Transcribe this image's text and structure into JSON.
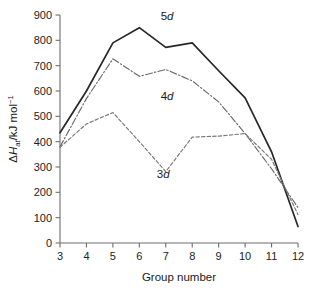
{
  "chart_data": {
    "type": "line",
    "title": "",
    "subtitle": "",
    "xlabel": "Group number",
    "ylabel": "ΔHₐₜ/kJ mol⁻¹",
    "ylabel_parts": {
      "delta": "Δ",
      "h": "H",
      "subscript": "at",
      "units": "/kJ mol",
      "exponent": "−1"
    },
    "x": [
      3,
      4,
      5,
      6,
      7,
      8,
      9,
      10,
      11,
      12
    ],
    "xtick_labels": [
      "3",
      "4",
      "5",
      "6",
      "7",
      "8",
      "9",
      "10",
      "11",
      "12"
    ],
    "ytick_labels": [
      "0",
      "100",
      "200",
      "300",
      "400",
      "500",
      "600",
      "700",
      "800",
      "900"
    ],
    "ytick_values": [
      0,
      100,
      200,
      300,
      400,
      500,
      600,
      700,
      800,
      900
    ],
    "xlim": [
      3,
      12
    ],
    "ylim": [
      0,
      900
    ],
    "grid": false,
    "legend_position": "inline-annotations",
    "series": [
      {
        "name": "5d",
        "label_html": "5<i>d</i>",
        "style": "solid",
        "color": "#272727",
        "values": [
          435,
          600,
          790,
          850,
          772,
          790,
          680,
          573,
          360,
          65
        ]
      },
      {
        "name": "4d",
        "label_html": "4<i>d</i>",
        "style": "dash-dot",
        "color": "#6a6a6a",
        "values": [
          380,
          570,
          727,
          658,
          685,
          640,
          557,
          432,
          293,
          140
        ]
      },
      {
        "name": "3d",
        "label_html": "3<i>d</i>",
        "style": "dashed",
        "color": "#777777",
        "values": [
          378,
          470,
          515,
          400,
          282,
          418,
          422,
          432,
          330,
          112
        ]
      }
    ],
    "annotations": [
      {
        "text": "5d",
        "digit": "5",
        "letter": "d",
        "x": 7.05,
        "y": 880
      },
      {
        "text": "4d",
        "digit": "4",
        "letter": "d",
        "x": 7.05,
        "y": 565
      },
      {
        "text": "3d",
        "digit": "3",
        "letter": "d",
        "x": 6.9,
        "y": 258
      }
    ]
  }
}
